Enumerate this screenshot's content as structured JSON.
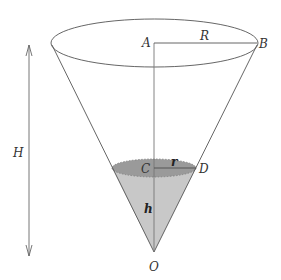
{
  "diagram": {
    "type": "cone-with-water",
    "colors": {
      "line": "#555555",
      "liquid_fill": "#c8c8c8",
      "liquid_surface": "#9a9a9a",
      "background": "#ffffff"
    },
    "points": {
      "A": {
        "label": "A"
      },
      "B": {
        "label": "B"
      },
      "C": {
        "label": "C"
      },
      "D": {
        "label": "D"
      },
      "O": {
        "label": "O"
      }
    },
    "segments": {
      "R": {
        "label": "R"
      },
      "r": {
        "label": "r"
      },
      "h": {
        "label": "h"
      },
      "H": {
        "label": "H"
      }
    }
  }
}
